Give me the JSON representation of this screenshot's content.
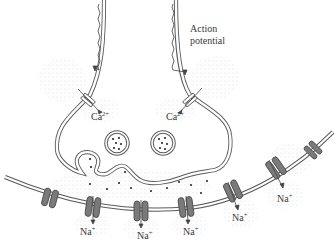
{
  "diagram": {
    "type": "synapse",
    "labels": {
      "action_potential_line1": "Action",
      "action_potential_line2": "potential",
      "ca_left": "Ca",
      "ca_left_charge": "2+",
      "ca_right": "Ca",
      "ca_right_charge": "2+",
      "na_1": "Na",
      "na_1_charge": "+",
      "na_2": "Na",
      "na_2_charge": "+",
      "na_3": "Na",
      "na_3_charge": "+",
      "na_4": "Na",
      "na_4_charge": "+",
      "na_5": "Na",
      "na_5_charge": "+"
    },
    "colors": {
      "membrane": "#5a5a5a",
      "channel_fill": "#7a7a7a",
      "stipple": "#b8b8b8",
      "text": "#3a3a3a"
    }
  }
}
